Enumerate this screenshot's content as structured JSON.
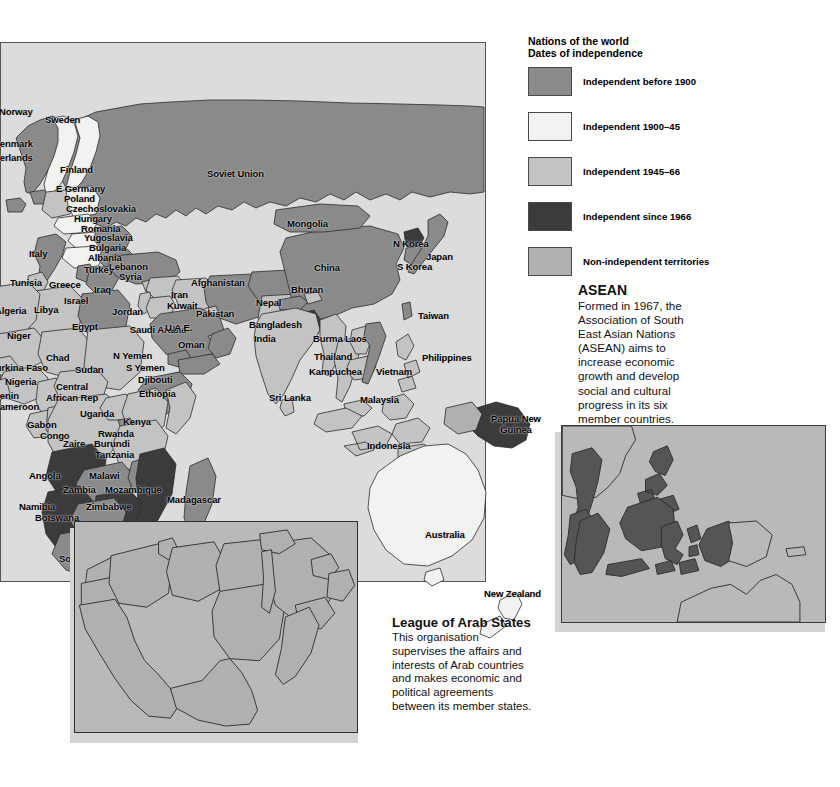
{
  "legend": {
    "title_line1": "Nations of the world",
    "title_line2": "Dates of independence",
    "items": [
      {
        "label": "Independent before 1900",
        "color": "#8a8a8a",
        "swatch_name": "legend-swatch-before-1900"
      },
      {
        "label": "Independent 1900–45",
        "color": "#f2f2f0",
        "swatch_name": "legend-swatch-1900-45"
      },
      {
        "label": "Independent 1945–66",
        "color": "#c3c3c3",
        "swatch_name": "legend-swatch-1945-66"
      },
      {
        "label": "Independent since 1966",
        "color": "#3b3b3b",
        "swatch_name": "legend-swatch-since-1966"
      },
      {
        "label": "Non-independent territories",
        "color": "#b0b0b0",
        "swatch_name": "legend-swatch-non-independent"
      }
    ]
  },
  "asean": {
    "heading": "ASEAN",
    "body": "Formed in 1967, the Association of South East Asian Nations (ASEAN) aims to increase economic growth and develop social and cultural progress in its six member countries."
  },
  "arab": {
    "heading": "League of Arab States",
    "body": "This organisation supervises the affairs and interests of Arab countries and makes economic and political agreements between its member states."
  },
  "map_labels": [
    {
      "name": "Norway",
      "x": -2,
      "y": 64,
      "cls": ""
    },
    {
      "name": "Sweden",
      "x": 44,
      "y": 72,
      "cls": ""
    },
    {
      "name": "Denmark",
      "x": -8,
      "y": 96,
      "cls": ""
    },
    {
      "name": "Netherlands",
      "x": -22,
      "y": 110,
      "cls": ""
    },
    {
      "name": "Finland",
      "x": 59,
      "y": 122,
      "cls": ""
    },
    {
      "name": "E Germany",
      "x": 55,
      "y": 141,
      "cls": ""
    },
    {
      "name": "Poland",
      "x": 63,
      "y": 151,
      "cls": ""
    },
    {
      "name": "Czechoslovakia",
      "x": 65,
      "y": 161,
      "cls": ""
    },
    {
      "name": "Hungary",
      "x": 73,
      "y": 171,
      "cls": ""
    },
    {
      "name": "Romania",
      "x": 80,
      "y": 181,
      "cls": ""
    },
    {
      "name": "Yugoslavia",
      "x": 83,
      "y": 190,
      "cls": ""
    },
    {
      "name": "Bulgaria",
      "x": 88,
      "y": 200,
      "cls": ""
    },
    {
      "name": "Albania",
      "x": 87,
      "y": 210,
      "cls": ""
    },
    {
      "name": "Italy",
      "x": 28,
      "y": 206,
      "cls": ""
    },
    {
      "name": "Turkey",
      "x": 83,
      "y": 222,
      "cls": ""
    },
    {
      "name": "Greece",
      "x": 48,
      "y": 237,
      "cls": ""
    },
    {
      "name": "Tunisia",
      "x": 9,
      "y": 235,
      "cls": ""
    },
    {
      "name": "Israel",
      "x": 63,
      "y": 253,
      "cls": ""
    },
    {
      "name": "Libya",
      "x": 33,
      "y": 262,
      "cls": ""
    },
    {
      "name": "Algeria",
      "x": -6,
      "y": 263,
      "cls": ""
    },
    {
      "name": "Egypt",
      "x": 71,
      "y": 279,
      "cls": ""
    },
    {
      "name": "Lebanon",
      "x": 108,
      "y": 219,
      "cls": ""
    },
    {
      "name": "Syria",
      "x": 118,
      "y": 229,
      "cls": ""
    },
    {
      "name": "Iraq",
      "x": 93,
      "y": 242,
      "cls": ""
    },
    {
      "name": "Jordan",
      "x": 111,
      "y": 264,
      "cls": ""
    },
    {
      "name": "Iran",
      "x": 170,
      "y": 247,
      "cls": ""
    },
    {
      "name": "Kuwait",
      "x": 166,
      "y": 258,
      "cls": ""
    },
    {
      "name": "Afghanistan",
      "x": 190,
      "y": 235,
      "cls": ""
    },
    {
      "name": "Pakistan",
      "x": 195,
      "y": 266,
      "cls": ""
    },
    {
      "name": "Saudi Arabia",
      "x": 126,
      "y": 281,
      "cls": "c2"
    },
    {
      "name": "U.A.E.",
      "x": 164,
      "y": 280,
      "cls": ""
    },
    {
      "name": "Oman",
      "x": 177,
      "y": 297,
      "cls": ""
    },
    {
      "name": "N Yemen",
      "x": 112,
      "y": 308,
      "cls": ""
    },
    {
      "name": "S Yemen",
      "x": 125,
      "y": 320,
      "cls": ""
    },
    {
      "name": "Djibouti",
      "x": 137,
      "y": 332,
      "cls": ""
    },
    {
      "name": "Ethiopia",
      "x": 138,
      "y": 346,
      "cls": ""
    },
    {
      "name": "Soviet Union",
      "x": 206,
      "y": 126,
      "cls": ""
    },
    {
      "name": "Mongolia",
      "x": 286,
      "y": 176,
      "cls": ""
    },
    {
      "name": "China",
      "x": 313,
      "y": 220,
      "cls": ""
    },
    {
      "name": "N Korea",
      "x": 392,
      "y": 196,
      "cls": ""
    },
    {
      "name": "S Korea",
      "x": 396,
      "y": 219,
      "cls": ""
    },
    {
      "name": "Japan",
      "x": 425,
      "y": 209,
      "cls": ""
    },
    {
      "name": "Taiwan",
      "x": 417,
      "y": 268,
      "cls": ""
    },
    {
      "name": "Bhutan",
      "x": 290,
      "y": 242,
      "cls": ""
    },
    {
      "name": "Nepal",
      "x": 255,
      "y": 255,
      "cls": ""
    },
    {
      "name": "Bangladesh",
      "x": 248,
      "y": 277,
      "cls": ""
    },
    {
      "name": "India",
      "x": 253,
      "y": 291,
      "cls": ""
    },
    {
      "name": "Burma",
      "x": 312,
      "y": 291,
      "cls": ""
    },
    {
      "name": "Laos",
      "x": 344,
      "y": 291,
      "cls": ""
    },
    {
      "name": "Thailand",
      "x": 313,
      "y": 309,
      "cls": ""
    },
    {
      "name": "Kampuchea",
      "x": 308,
      "y": 324,
      "cls": ""
    },
    {
      "name": "Vietnam",
      "x": 375,
      "y": 324,
      "cls": ""
    },
    {
      "name": "Philippines",
      "x": 421,
      "y": 310,
      "cls": ""
    },
    {
      "name": "Sri Lanka",
      "x": 268,
      "y": 350,
      "cls": ""
    },
    {
      "name": "Malaysia",
      "x": 359,
      "y": 352,
      "cls": ""
    },
    {
      "name": "Indonesia",
      "x": 366,
      "y": 398,
      "cls": ""
    },
    {
      "name": "Papua New Guinea",
      "x": 484,
      "y": 370,
      "cls": "c2"
    },
    {
      "name": "Australia",
      "x": 424,
      "y": 487,
      "cls": ""
    },
    {
      "name": "New Zealand",
      "x": 483,
      "y": 546,
      "cls": ""
    },
    {
      "name": "Niger",
      "x": 6,
      "y": 288,
      "cls": ""
    },
    {
      "name": "Chad",
      "x": 45,
      "y": 310,
      "cls": ""
    },
    {
      "name": "Sudan",
      "x": 74,
      "y": 322,
      "cls": ""
    },
    {
      "name": "Burkina Faso",
      "x": -12,
      "y": 320,
      "cls": ""
    },
    {
      "name": "Nigeria",
      "x": 4,
      "y": 334,
      "cls": ""
    },
    {
      "name": "Central African Rep",
      "x": 40,
      "y": 338,
      "cls": "c2"
    },
    {
      "name": "Benin",
      "x": -8,
      "y": 348,
      "cls": ""
    },
    {
      "name": "Cameroon",
      "x": -8,
      "y": 359,
      "cls": ""
    },
    {
      "name": "Gabon",
      "x": 26,
      "y": 377,
      "cls": ""
    },
    {
      "name": "Congo",
      "x": 39,
      "y": 388,
      "cls": ""
    },
    {
      "name": "Zaire",
      "x": 62,
      "y": 396,
      "cls": ""
    },
    {
      "name": "Uganda",
      "x": 79,
      "y": 366,
      "cls": ""
    },
    {
      "name": "Kenya",
      "x": 122,
      "y": 374,
      "cls": ""
    },
    {
      "name": "Rwanda",
      "x": 97,
      "y": 386,
      "cls": ""
    },
    {
      "name": "Burundi",
      "x": 93,
      "y": 396,
      "cls": ""
    },
    {
      "name": "Tanzania",
      "x": 94,
      "y": 407,
      "cls": ""
    },
    {
      "name": "Angola",
      "x": 28,
      "y": 428,
      "cls": ""
    },
    {
      "name": "Malawi",
      "x": 88,
      "y": 428,
      "cls": ""
    },
    {
      "name": "Zambia",
      "x": 62,
      "y": 442,
      "cls": ""
    },
    {
      "name": "Mozambique",
      "x": 104,
      "y": 442,
      "cls": ""
    },
    {
      "name": "Madagascar",
      "x": 166,
      "y": 452,
      "cls": ""
    },
    {
      "name": "Namibia",
      "x": 18,
      "y": 459,
      "cls": ""
    },
    {
      "name": "Zimbabwe",
      "x": 85,
      "y": 459,
      "cls": ""
    },
    {
      "name": "Botswana",
      "x": 34,
      "y": 470,
      "cls": ""
    },
    {
      "name": "Swaziland",
      "x": 105,
      "y": 487,
      "cls": ""
    },
    {
      "name": "Lesotho",
      "x": 82,
      "y": 500,
      "cls": ""
    },
    {
      "name": "South Africa",
      "x": 58,
      "y": 511,
      "cls": ""
    }
  ]
}
